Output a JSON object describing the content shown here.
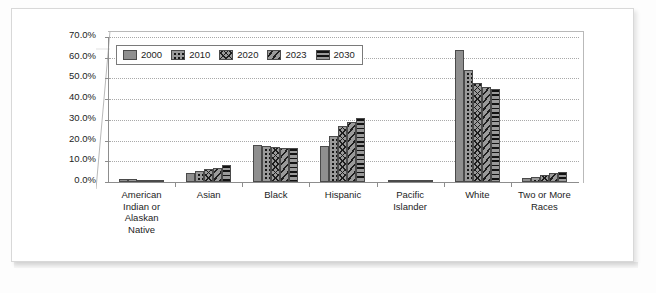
{
  "chart_data": {
    "type": "bar",
    "title": "",
    "subtitle": "",
    "xlabel": "",
    "ylabel": "",
    "ylim": [
      0,
      70
    ],
    "ytick_labels": [
      "70.0%",
      "60.0%",
      "50.0%",
      "40.0%",
      "30.0%",
      "20.0%",
      "10.0%",
      "0.0%"
    ],
    "ytick_values": [
      70,
      60,
      50,
      40,
      30,
      20,
      10,
      0
    ],
    "grid": true,
    "legend_position": "top-left",
    "categories": [
      "American Indian or Alaskan Native",
      "Asian",
      "Black",
      "Hispanic",
      "Pacific Islander",
      "White",
      "Two or More Races"
    ],
    "category_label_lines": [
      [
        "American",
        "Indian or",
        "Alaskan",
        "Native"
      ],
      [
        "Asian"
      ],
      [
        "Black"
      ],
      [
        "Hispanic"
      ],
      [
        "Pacific",
        "Islander"
      ],
      [
        "White"
      ],
      [
        "Two or More",
        "Races"
      ]
    ],
    "series": [
      {
        "name": "2000",
        "pattern": "solid",
        "values": [
          1.5,
          4.5,
          18.0,
          17.5,
          0.3,
          63.5,
          1.8
        ]
      },
      {
        "name": "2010",
        "pattern": "dots",
        "values": [
          1.3,
          5.5,
          17.5,
          22.0,
          0.3,
          54.0,
          2.5
        ]
      },
      {
        "name": "2020",
        "pattern": "crosshatch",
        "values": [
          1.2,
          6.5,
          17.0,
          27.0,
          0.3,
          48.0,
          3.5
        ]
      },
      {
        "name": "2023",
        "pattern": "diagonal-stripes",
        "values": [
          1.2,
          7.0,
          16.5,
          29.0,
          0.3,
          46.0,
          4.5
        ]
      },
      {
        "name": "2030",
        "pattern": "horizontal-stripes",
        "values": [
          1.2,
          8.0,
          16.5,
          31.0,
          0.4,
          45.0,
          5.0
        ]
      }
    ],
    "colors": {
      "bar_fill": "#8f8f8f",
      "bar_pattern": "#1d1d1d",
      "bar_border": "#4a4a4a",
      "gridline": "#a9a9a9",
      "axis": "#8d8d8d",
      "text": "#1d1d1d",
      "plot_background": "#ffffff",
      "page_background": "#fdfdfd",
      "frame_border": "#d8d8d8"
    }
  }
}
